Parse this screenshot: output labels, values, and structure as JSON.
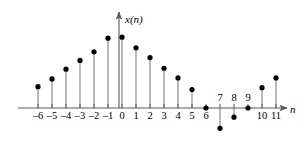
{
  "figure": {
    "axis_label_y": "x(n)",
    "axis_label_x": "n",
    "line_color": "#808080",
    "dot_color": "#000000",
    "axis_color": "#595959",
    "background": "#ffffff"
  },
  "chart_data": {
    "type": "scatter",
    "subtype": "stem",
    "title": "",
    "xlabel": "n",
    "ylabel": "x(n)",
    "x": [
      -6,
      -5,
      -4,
      -3,
      -2,
      -1,
      0,
      1,
      2,
      3,
      4,
      5,
      6,
      7,
      8,
      9,
      10,
      11
    ],
    "values": [
      2.2,
      3.0,
      4.0,
      4.9,
      5.8,
      7.2,
      7.3,
      6.2,
      5.2,
      4.1,
      3.1,
      1.9,
      0.0,
      -2.1,
      -0.95,
      0.0,
      2.1,
      3.1
    ],
    "tick_labels_below_axis": [
      "-6",
      "-5",
      "-4",
      "-3",
      "-2",
      "-1",
      "0",
      "1",
      "2",
      "3",
      "4",
      "5",
      "6",
      "10",
      "11"
    ],
    "tick_labels_above_axis": [
      "7",
      "8",
      "9"
    ],
    "grid": false,
    "legend": false,
    "xlim": [
      -7.5,
      12.5
    ],
    "ylim": [
      -2.6,
      9.8
    ],
    "axis_arrows": [
      "x-right",
      "y-up"
    ]
  }
}
